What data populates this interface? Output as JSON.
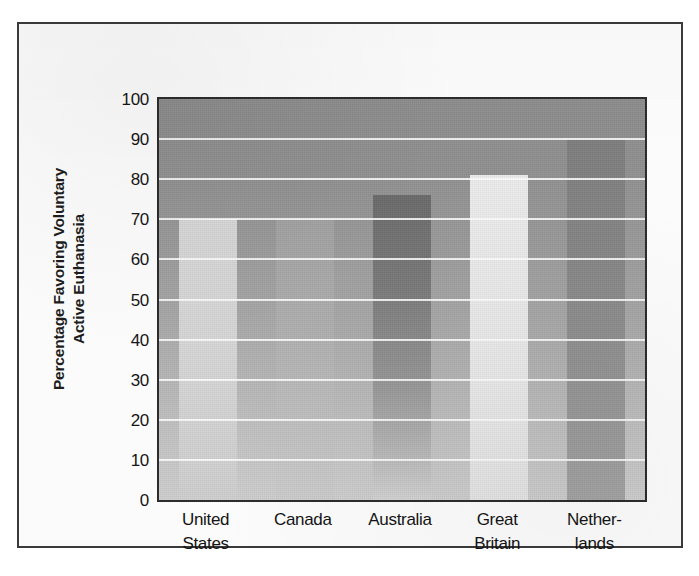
{
  "figure": {
    "border_color": "#3a3a3a",
    "background": "#fbfbfb"
  },
  "axis": {
    "y_title_line1": "Percentage Favoring Voluntary",
    "y_title_line2": "Active Euthanasia"
  },
  "chart_data": {
    "type": "bar",
    "title": "",
    "subtitle": "",
    "xlabel": "",
    "ylabel": "Percentage Favoring Voluntary Active Euthanasia",
    "ylim": [
      0,
      100
    ],
    "ytick_interval": 10,
    "yticks": [
      0,
      10,
      20,
      30,
      40,
      50,
      60,
      70,
      80,
      90,
      100
    ],
    "ytick_labels": [
      "0",
      "10",
      "20",
      "30",
      "40",
      "50",
      "60",
      "70",
      "80",
      "90",
      "100"
    ],
    "grid": "horizontal-white",
    "gridline_color": "#ffffff",
    "legend": "none",
    "categories": [
      "United States",
      "Canada",
      "Australia",
      "Great Britain",
      "Netherlands"
    ],
    "category_label_lines": [
      [
        "United",
        "States"
      ],
      [
        "Canada"
      ],
      [
        "Australia"
      ],
      [
        "Great",
        "Britain"
      ],
      [
        "Nether-",
        "lands"
      ]
    ],
    "values": [
      70,
      70,
      76,
      81,
      90
    ],
    "bar_colors": [
      "#d8d8d8",
      "#b0b0b0",
      "#7a7a7a",
      "#ebebeb",
      "#8c8c8c"
    ],
    "plot_background": "gray-vertical-gradient",
    "plot_background_top": "#8d8d8d",
    "plot_background_bottom": "#cfcfcf"
  }
}
